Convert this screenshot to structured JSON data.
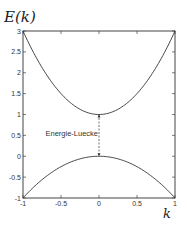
{
  "chart_data": {
    "type": "line",
    "title": "",
    "ylabel": "E(k)",
    "xlabel": "k",
    "xlim": [
      -1,
      1
    ],
    "ylim": [
      -1,
      3
    ],
    "xticks": [
      -1,
      -0.5,
      0,
      0.5,
      1
    ],
    "xtick_labels": [
      "-1",
      "-0.5",
      "0",
      "0.5",
      "1"
    ],
    "yticks": [
      -1,
      -0.5,
      0,
      0.5,
      1,
      1.5,
      2,
      2.5,
      3
    ],
    "ytick_labels": [
      "-1",
      "-0.5",
      "0",
      "0.5",
      "1",
      "1.5",
      "2",
      "2.5",
      "3"
    ],
    "grid": false,
    "legend": null,
    "series": [
      {
        "name": "upper band",
        "formula": "E = 1 + 2k^2",
        "x": [
          -1,
          -0.75,
          -0.5,
          -0.25,
          0,
          0.25,
          0.5,
          0.75,
          1
        ],
        "values": [
          3,
          2.125,
          1.5,
          1.125,
          1,
          1.125,
          1.5,
          2.125,
          3
        ]
      },
      {
        "name": "lower band",
        "formula": "E = -k^2",
        "x": [
          -1,
          -0.75,
          -0.5,
          -0.25,
          0,
          0.25,
          0.5,
          0.75,
          1
        ],
        "values": [
          -1,
          -0.5625,
          -0.25,
          -0.0625,
          0,
          -0.0625,
          -0.25,
          -0.5625,
          -1
        ]
      }
    ],
    "annotations": [
      {
        "text": "Energie-Luecke",
        "type": "dashed-gap-line",
        "x": 0,
        "y_from": 0,
        "y_to": 1
      }
    ]
  },
  "labels": {
    "y_axis": "E(k)",
    "x_axis": "k",
    "gap": "Energie-Luecke"
  }
}
